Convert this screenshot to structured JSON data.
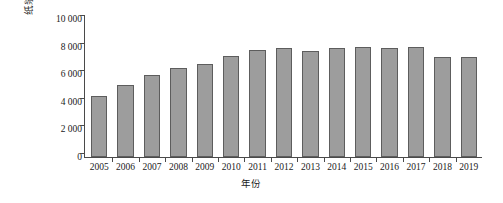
{
  "chart_data": {
    "type": "bar",
    "title": "",
    "subtitle": "",
    "xlabel": "年份",
    "ylabel": "纸浆产量/万t",
    "categories": [
      "2005",
      "2006",
      "2007",
      "2008",
      "2009",
      "2010",
      "2011",
      "2012",
      "2013",
      "2014",
      "2015",
      "2016",
      "2017",
      "2018",
      "2019"
    ],
    "values": [
      4450,
      5200,
      5950,
      6420,
      6750,
      7300,
      7750,
      7900,
      7650,
      7920,
      7990,
      7930,
      7990,
      7250,
      7250
    ],
    "series": [
      {
        "name": "纸浆产量",
        "values": [
          4450,
          5200,
          5950,
          6420,
          6750,
          7300,
          7750,
          7900,
          7650,
          7920,
          7990,
          7930,
          7990,
          7250,
          7250
        ]
      }
    ],
    "ylim": [
      0,
      10000
    ],
    "ytick_values": [
      0,
      2000,
      4000,
      6000,
      8000,
      10000
    ],
    "ytick_labels": [
      "0",
      "2 000",
      "4 000",
      "6 000",
      "8 000",
      "10 000"
    ],
    "grid": false,
    "legend": false,
    "legend_position": "none",
    "bar_fill_color": "#9d9d9d",
    "bar_border_color": "#5d5d5d",
    "axis_color": "#4a4a4a",
    "background_color": "#ffffff"
  }
}
